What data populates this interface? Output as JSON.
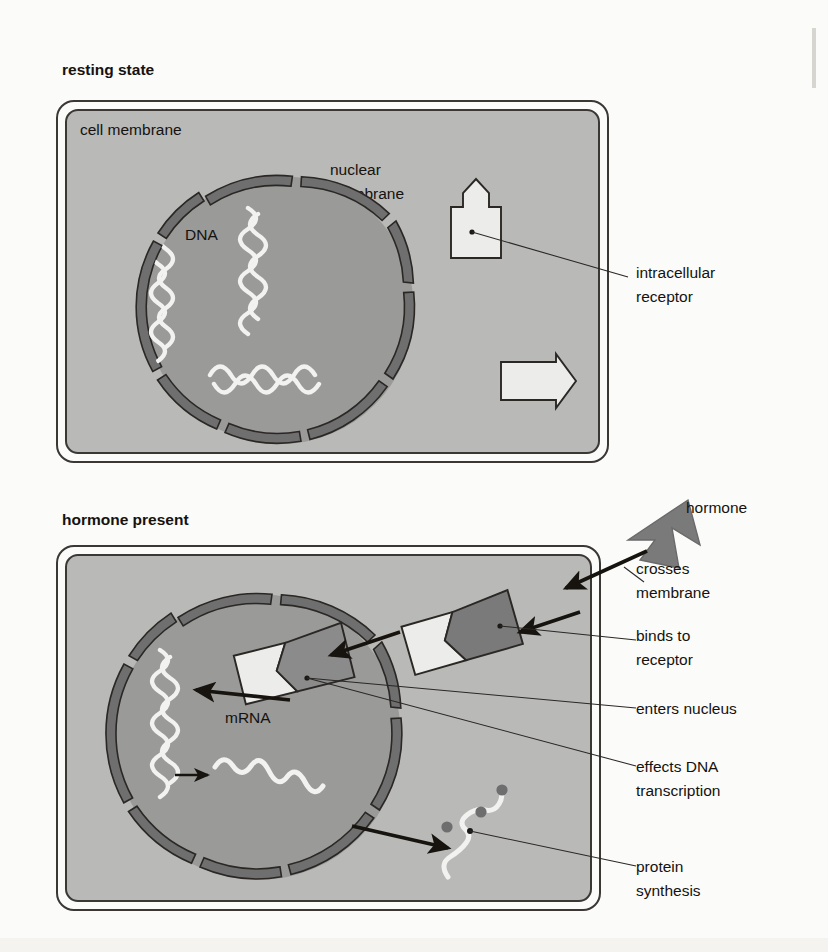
{
  "figure": {
    "kind": "biology-diagram",
    "background_color": "#fbfbf9"
  },
  "palette": {
    "cytoplasm": "#b9b9b7",
    "nucleoplasm": "#9a9a99",
    "nuclear_membrane": "#6f6f70",
    "receptor_light": "#ececea",
    "hormone_dark": "#7a7a7b",
    "complex_mid": "#8b8b8c",
    "dna_white": "#f2f2f0",
    "mrna_white": "#f2f2f0",
    "outline": "#2a2724",
    "text": "#15120f",
    "page_edge": "#d7d5cf"
  },
  "panels": [
    {
      "id": "resting",
      "title": "resting state",
      "inner_labels": [
        {
          "id": "cell-membrane",
          "text": "cell membrane"
        },
        {
          "id": "nuclear-membrane-line1",
          "text": "nuclear"
        },
        {
          "id": "nuclear-membrane-line2",
          "text": "membrane"
        },
        {
          "id": "dna",
          "text": "DNA"
        }
      ],
      "side_labels": [
        {
          "id": "intracellular-receptor",
          "lines": [
            "intracellular",
            "receptor"
          ]
        }
      ],
      "contents": {
        "dna_strand_count": 3,
        "receptor_count": 2,
        "nuclear_membrane_segments": 8
      }
    },
    {
      "id": "hormone-present",
      "title": "hormone present",
      "inner_labels": [
        {
          "id": "mrna",
          "text": "mRNA"
        }
      ],
      "side_labels": [
        {
          "id": "hormone",
          "lines": [
            "hormone"
          ]
        },
        {
          "id": "crosses-membrane",
          "lines": [
            "crosses",
            "membrane"
          ]
        },
        {
          "id": "binds-to-receptor",
          "lines": [
            "binds to",
            "receptor"
          ]
        },
        {
          "id": "enters-nucleus",
          "lines": [
            "enters nucleus"
          ]
        },
        {
          "id": "effects-dna-transcription",
          "lines": [
            "effects DNA",
            "transcription"
          ]
        },
        {
          "id": "protein-synthesis",
          "lines": [
            "protein",
            "synthesis"
          ]
        }
      ],
      "contents": {
        "dna_strand_count": 1,
        "mrna_strand_count": 2,
        "ribosome_count": 3,
        "nuclear_membrane_segments": 8,
        "hormone_receptor_complexes": 2
      }
    }
  ]
}
